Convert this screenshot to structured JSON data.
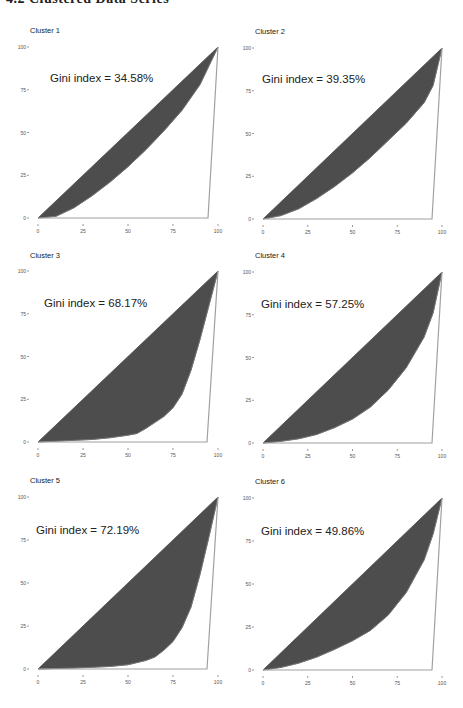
{
  "header": {
    "title": "4.2 Clustered Data Series"
  },
  "colors": {
    "fill": "#4d4d4d",
    "outline": "#a0a0a0",
    "axis_text": "#555555",
    "title_text": "#222222"
  },
  "chart_data": [
    {
      "type": "area",
      "title": "Cluster 1",
      "annotation": "Gini index = 34.58%",
      "xlabel": "",
      "ylabel": "",
      "x_ticks": [
        "0",
        "25",
        "50",
        "75",
        "100"
      ],
      "y_ticks": [
        "0",
        "25",
        "50",
        "75",
        "100"
      ],
      "xlim": [
        0,
        100
      ],
      "ylim": [
        0,
        100
      ],
      "grid": false,
      "lorenz": {
        "x": [
          0,
          10,
          20,
          30,
          40,
          50,
          60,
          70,
          80,
          90,
          100
        ],
        "y": [
          0,
          1,
          6,
          13,
          21,
          30,
          40,
          51,
          63,
          78,
          100
        ]
      },
      "frame": {
        "x0": 38,
        "x100": 218,
        "y100": 47,
        "y0": 218,
        "title_y": 33,
        "ann_x": 50,
        "ann_y": 82,
        "base_end": 208
      }
    },
    {
      "type": "area",
      "title": "Cluster 2",
      "annotation": "Gini index = 39.35%",
      "xlabel": "",
      "ylabel": "",
      "x_ticks": [
        "0",
        "25",
        "50",
        "75",
        "100"
      ],
      "y_ticks": [
        "0",
        "25",
        "50",
        "75",
        "100"
      ],
      "xlim": [
        0,
        100
      ],
      "ylim": [
        0,
        100
      ],
      "grid": false,
      "lorenz": {
        "x": [
          0,
          10,
          20,
          30,
          40,
          50,
          60,
          70,
          80,
          90,
          95,
          100
        ],
        "y": [
          0,
          2,
          6,
          12,
          19,
          27,
          36,
          46,
          56,
          68,
          78,
          100
        ]
      },
      "frame": {
        "x0": 263,
        "x100": 442,
        "y100": 48,
        "y0": 219,
        "title_y": 34,
        "ann_x": 262,
        "ann_y": 83,
        "base_end": 432
      }
    },
    {
      "type": "area",
      "title": "Cluster 3",
      "annotation": "Gini index = 68.17%",
      "xlabel": "",
      "ylabel": "",
      "x_ticks": [
        "0",
        "25",
        "50",
        "75",
        "100"
      ],
      "y_ticks": [
        "0",
        "25",
        "50",
        "75",
        "100"
      ],
      "xlim": [
        0,
        100
      ],
      "ylim": [
        0,
        100
      ],
      "grid": false,
      "lorenz": {
        "x": [
          0,
          10,
          20,
          30,
          40,
          50,
          55,
          60,
          70,
          75,
          80,
          85,
          90,
          95,
          100
        ],
        "y": [
          0,
          0.5,
          1,
          1.5,
          2.5,
          4,
          5,
          8,
          15,
          20,
          28,
          42,
          60,
          80,
          100
        ]
      },
      "frame": {
        "x0": 38,
        "x100": 218,
        "y100": 271,
        "y0": 442,
        "title_y": 258,
        "ann_x": 44,
        "ann_y": 307,
        "base_end": 207
      }
    },
    {
      "type": "area",
      "title": "Cluster 4",
      "annotation": "Gini index = 57.25%",
      "xlabel": "",
      "ylabel": "",
      "x_ticks": [
        "0",
        "25",
        "50",
        "75",
        "100"
      ],
      "y_ticks": [
        "0",
        "25",
        "50",
        "75",
        "100"
      ],
      "xlim": [
        0,
        100
      ],
      "ylim": [
        0,
        100
      ],
      "grid": false,
      "lorenz": {
        "x": [
          0,
          10,
          20,
          30,
          40,
          50,
          60,
          70,
          80,
          90,
          95,
          100
        ],
        "y": [
          0,
          1,
          2.5,
          5,
          9,
          14,
          21,
          31,
          44,
          62,
          76,
          100
        ]
      },
      "frame": {
        "x0": 263,
        "x100": 442,
        "y100": 272,
        "y0": 443,
        "title_y": 258,
        "ann_x": 261,
        "ann_y": 308,
        "base_end": 432
      }
    },
    {
      "type": "area",
      "title": "Cluster 5",
      "annotation": "Gini index = 72.19%",
      "xlabel": "",
      "ylabel": "",
      "x_ticks": [
        "0",
        "25",
        "50",
        "75",
        "100"
      ],
      "y_ticks": [
        "0",
        "25",
        "50",
        "75",
        "100"
      ],
      "xlim": [
        0,
        100
      ],
      "ylim": [
        0,
        100
      ],
      "grid": false,
      "lorenz": {
        "x": [
          0,
          10,
          20,
          30,
          40,
          50,
          60,
          65,
          70,
          75,
          80,
          85,
          90,
          95,
          100
        ],
        "y": [
          0,
          0.3,
          0.6,
          1,
          1.5,
          2.5,
          5,
          7,
          11,
          16,
          24,
          36,
          55,
          77,
          100
        ]
      },
      "frame": {
        "x0": 38,
        "x100": 218,
        "y100": 497,
        "y0": 669,
        "title_y": 483,
        "ann_x": 36,
        "ann_y": 534,
        "base_end": 207
      }
    },
    {
      "type": "area",
      "title": "Cluster 6",
      "annotation": "Gini index = 49.86%",
      "xlabel": "",
      "ylabel": "",
      "x_ticks": [
        "0",
        "25",
        "50",
        "75",
        "100"
      ],
      "y_ticks": [
        "0",
        "25",
        "50",
        "75",
        "100"
      ],
      "xlim": [
        0,
        100
      ],
      "ylim": [
        0,
        100
      ],
      "grid": false,
      "lorenz": {
        "x": [
          0,
          10,
          20,
          30,
          40,
          50,
          60,
          70,
          80,
          90,
          95,
          100
        ],
        "y": [
          0,
          1.5,
          4,
          7.5,
          12,
          17,
          23,
          32,
          45,
          64,
          79,
          100
        ]
      },
      "frame": {
        "x0": 263,
        "x100": 442,
        "y100": 498,
        "y0": 670,
        "title_y": 484,
        "ann_x": 261,
        "ann_y": 535,
        "base_end": 432
      }
    }
  ]
}
